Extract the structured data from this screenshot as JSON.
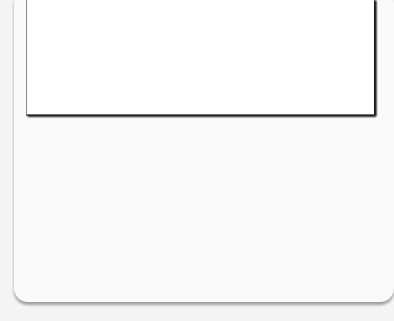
{
  "diagram": {
    "steps": [
      {
        "label": "1. Identify the question and define relevant variables",
        "color": "#e0e0e0"
      },
      {
        "label": "2. Specify assumptions",
        "color": "#d9d9d9"
      },
      {
        "label": "3. Formulate a hypothesis",
        "color": "#bdbdbd"
      },
      {
        "label": "4. Test the hypothesis",
        "color": "#c4c4c4"
      }
    ],
    "outcomes": {
      "connector": "or",
      "reject": {
        "label": "Reject the hypothesis",
        "color": "#dcdcdc"
      },
      "accept": {
        "label": "Use the hypothesis until a better one shows up",
        "color": "#c4c4c4"
      }
    },
    "feedback": {
      "label": "Modify approach",
      "color": "#d3d3d3"
    }
  }
}
